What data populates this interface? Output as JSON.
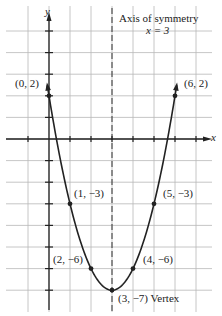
{
  "chart_data": {
    "type": "line",
    "title": "",
    "xlabel": "x",
    "ylabel": "y",
    "function": "y = x^2 - 6x + 2",
    "x": [
      0,
      1,
      2,
      3,
      4,
      5,
      6
    ],
    "series": [
      {
        "name": "parabola",
        "values": [
          2,
          -3,
          -6,
          -7,
          -6,
          -3,
          2
        ]
      }
    ],
    "points": [
      {
        "label": "(0, 2)",
        "x": 0,
        "y": 2
      },
      {
        "label": "(1, −3)",
        "x": 1,
        "y": -3
      },
      {
        "label": "(2, −6)",
        "x": 2,
        "y": -6
      },
      {
        "label": "(3, −7) Vertex",
        "x": 3,
        "y": -7
      },
      {
        "label": "(4, −6)",
        "x": 4,
        "y": -6
      },
      {
        "label": "(5, −3)",
        "x": 5,
        "y": -3
      },
      {
        "label": "(6, 2)",
        "x": 6,
        "y": 2
      }
    ],
    "annotations": [
      "Axis of symmetry",
      "x = 3"
    ],
    "axis_of_symmetry": 3,
    "xlim": [
      -1,
      7
    ],
    "ylim": [
      -7,
      6
    ],
    "grid": true,
    "legend": "none"
  },
  "labels": {
    "y_axis": "y",
    "x_axis": "x",
    "axis_title": "Axis of  symmetry",
    "axis_eq": "x = 3",
    "p0": "(0, 2)",
    "p1": "(1, −3)",
    "p2": "(2, −6)",
    "p3": "(3, −7) Vertex",
    "p4": "(4, −6)",
    "p5": "(5, −3)",
    "p6": "(6, 2)"
  }
}
